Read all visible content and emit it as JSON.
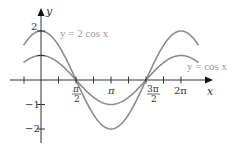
{
  "chart_data": {
    "type": "line",
    "title": "",
    "xlabel": "x",
    "ylabel": "y",
    "x_range": [
      -0.785,
      7.07
    ],
    "ylim": [
      -2.5,
      2.5
    ],
    "grid": false,
    "legend": "inline labels",
    "x_ticks": [
      {
        "value": 1.5708,
        "label_num": "π",
        "label_den": "2"
      },
      {
        "value": 3.1416,
        "label": "π"
      },
      {
        "value": 4.7124,
        "label_num": "3π",
        "label_den": "2"
      },
      {
        "value": 6.2832,
        "label": "2π"
      }
    ],
    "y_ticks": [
      {
        "value": 2,
        "label": "2"
      },
      {
        "value": 1,
        "label": ""
      },
      {
        "value": -1,
        "label": "−1"
      },
      {
        "value": -2,
        "label": "−2"
      }
    ],
    "series": [
      {
        "name": "y = 2 cos x",
        "amplitude": 2,
        "function": "2*cos(x)",
        "color": "#8c8c8c"
      },
      {
        "name": "y = cos x",
        "amplitude": 1,
        "function": "cos(x)",
        "color": "#8c8c8c"
      }
    ],
    "annotations": [
      {
        "text": "y = 2 cos x",
        "near_series": 0
      },
      {
        "text": "y = cos x",
        "near_series": 1
      }
    ]
  },
  "labels": {
    "x_axis": "x",
    "y_axis": "y",
    "y2": "2",
    "ym1": "−1",
    "ym2": "−2",
    "pi_half_num": "π",
    "pi_half_den": "2",
    "pi": "π",
    "three_pi_half_num": "3π",
    "three_pi_half_den": "2",
    "two_pi": "2π",
    "curve_2cos": "y = 2 cos x",
    "curve_cos": "y = cos x"
  }
}
